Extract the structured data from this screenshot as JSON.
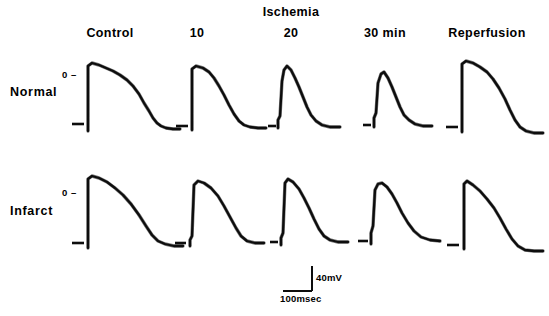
{
  "figure": {
    "group_header": "Ischemia",
    "columns": [
      {
        "label": "Control",
        "x": 110
      },
      {
        "label": "10",
        "x": 197
      },
      {
        "label": "20",
        "x": 291
      },
      {
        "label": "30 min",
        "x": 385
      },
      {
        "label": "Reperfusion",
        "x": 487
      }
    ],
    "rows": [
      {
        "label": "Normal",
        "y": 93
      },
      {
        "label": "Infarct",
        "y": 212
      }
    ],
    "zero_markers": [
      {
        "label": "0 –",
        "x": 62,
        "y": 70
      },
      {
        "label": "0 –",
        "x": 62,
        "y": 188
      }
    ],
    "scalebar": {
      "vertical_label": "40mV",
      "horizontal_label": "100msec"
    }
  },
  "chart_data": {
    "type": "line",
    "title": "Ischemia",
    "xlabel": "",
    "ylabel": "",
    "column_categories": [
      "Control",
      "10",
      "20",
      "30 min",
      "Reperfusion"
    ],
    "row_categories": [
      "Normal",
      "Infarct"
    ],
    "scale": {
      "voltage": "40mV",
      "time": "100msec"
    },
    "reference_level": "0",
    "panels": [
      {
        "row": "Normal",
        "column": "Control",
        "baseline_dash": {
          "x1": 72,
          "x2": 84,
          "y": 124
        },
        "points": "M 88 131 L 88 66 L 92 63 L 99 65 L 106 68 L 113 71 L 120 75 L 127 80 L 133 86 L 139 94 L 144 103 L 149 111 L 153 118 L 157 123 L 161 126 L 166 128 L 173 129 L 180 129"
      },
      {
        "row": "Normal",
        "column": "10",
        "baseline_dash": {
          "x1": 176,
          "x2": 188,
          "y": 126
        },
        "points": "M 192 130 L 192 69 L 196 66 L 203 68 L 209 72 L 214 78 L 219 86 L 224 95 L 229 105 L 234 114 L 239 121 L 244 125 L 250 127 L 258 128 L 266 128"
      },
      {
        "row": "Normal",
        "column": "20",
        "baseline_dash": {
          "x1": 268,
          "x2": 276,
          "y": 126
        },
        "points": "M 278 128 L 278 120 L 280 116 L 282 81 L 284 70 L 287 66 L 291 70 L 295 78 L 299 87 L 303 97 L 307 107 L 311 115 L 316 121 L 322 125 L 330 127 L 340 127"
      },
      {
        "row": "Normal",
        "column": "30 min",
        "baseline_dash": {
          "x1": 363,
          "x2": 371,
          "y": 125
        },
        "points": "M 374 127 L 374 118 L 376 113 L 378 83 L 381 74 L 384 72 L 388 78 L 392 87 L 396 97 L 400 107 L 404 115 L 409 120 L 415 124 L 423 126 L 432 126"
      },
      {
        "row": "Normal",
        "column": "Reperfusion",
        "baseline_dash": {
          "x1": 446,
          "x2": 458,
          "y": 127
        },
        "points": "M 462 132 L 462 64 L 466 61 L 473 63 L 480 67 L 487 72 L 493 79 L 499 88 L 505 99 L 510 110 L 515 120 L 520 127 L 526 131 L 534 133 L 543 133"
      },
      {
        "row": "Infarct",
        "column": "Control",
        "baseline_dash": {
          "x1": 72,
          "x2": 84,
          "y": 243
        },
        "points": "M 88 248 L 88 179 L 92 176 L 99 178 L 107 182 L 115 188 L 123 195 L 131 204 L 139 215 L 146 226 L 152 235 L 158 241 L 165 244 L 174 246 L 183 246"
      },
      {
        "row": "Infarct",
        "column": "10",
        "baseline_dash": {
          "x1": 175,
          "x2": 186,
          "y": 243
        },
        "points": "M 190 246 L 190 240 L 192 236 L 194 185 L 198 181 L 204 183 L 211 188 L 218 196 L 224 206 L 230 217 L 236 228 L 241 236 L 247 241 L 255 243 L 264 243"
      },
      {
        "row": "Infarct",
        "column": "20",
        "baseline_dash": {
          "x1": 270,
          "x2": 278,
          "y": 242
        },
        "points": "M 281 245 L 281 238 L 283 233 L 285 183 L 288 179 L 293 182 L 299 189 L 304 198 L 309 208 L 314 219 L 319 229 L 324 236 L 330 240 L 338 242 L 348 242"
      },
      {
        "row": "Infarct",
        "column": "30 min",
        "baseline_dash": {
          "x1": 358,
          "x2": 368,
          "y": 241
        },
        "points": "M 371 244 L 371 233 L 373 226 L 375 190 L 378 184 L 382 183 L 387 187 L 392 194 L 397 203 L 402 213 L 408 223 L 414 231 L 421 237 L 430 240 L 440 241"
      },
      {
        "row": "Infarct",
        "column": "Reperfusion",
        "baseline_dash": {
          "x1": 447,
          "x2": 459,
          "y": 245
        },
        "points": "M 464 249 L 464 184 L 467 181 L 473 185 L 480 191 L 487 199 L 494 208 L 500 218 L 506 229 L 512 239 L 518 246 L 525 250 L 534 251 L 543 251"
      }
    ]
  }
}
